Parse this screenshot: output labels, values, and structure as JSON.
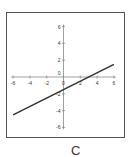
{
  "chart_data": {
    "type": "line",
    "title": "",
    "caption": "C",
    "xlabel": "",
    "ylabel": "",
    "xlim": [
      -6,
      6
    ],
    "ylim": [
      -6,
      6
    ],
    "x_ticks": [
      -6,
      -4,
      -2,
      0,
      2,
      4,
      6
    ],
    "y_ticks": [
      -6,
      -4,
      -2,
      0,
      2,
      4,
      6
    ],
    "grid": false,
    "legend": null,
    "series": [
      {
        "name": "line",
        "equation": "y = 0.5x - 1.5",
        "x": [
          -6,
          6
        ],
        "y": [
          -4.5,
          1.5
        ]
      }
    ]
  },
  "colors": {
    "frame": "#555555",
    "axis": "#888888",
    "line": "#333333",
    "text": "#333333"
  }
}
